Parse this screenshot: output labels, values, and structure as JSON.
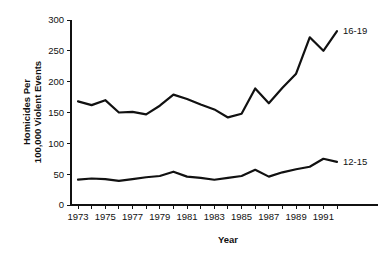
{
  "chart_data": {
    "type": "line",
    "title": "",
    "xlabel": "Year",
    "ylabel": "Homicides Per 100,000 Violent Events",
    "ylabel_line1": "Homicides Per",
    "ylabel_line2": "100,000 Violent Events",
    "grid": false,
    "legend_position": "inline-right",
    "xlim": [
      1973,
      1992
    ],
    "ylim": [
      0,
      300
    ],
    "ytick_values": [
      0,
      50,
      100,
      150,
      200,
      250,
      300
    ],
    "ytick_labels": [
      "0",
      "50",
      "100",
      "150",
      "200",
      "250",
      "300"
    ],
    "x": [
      1973,
      1974,
      1975,
      1976,
      1977,
      1978,
      1979,
      1980,
      1981,
      1982,
      1983,
      1984,
      1985,
      1986,
      1987,
      1988,
      1989,
      1990,
      1991,
      1992
    ],
    "xtick_values": [
      1973,
      1974,
      1975,
      1976,
      1977,
      1978,
      1979,
      1980,
      1981,
      1982,
      1983,
      1984,
      1985,
      1986,
      1987,
      1988,
      1989,
      1990,
      1991,
      1992
    ],
    "xtick_labels": [
      "1973",
      "",
      "1975",
      "",
      "1977",
      "",
      "1979",
      "",
      "1981",
      "",
      "1983",
      "",
      "1985",
      "",
      "1987",
      "",
      "1989",
      "",
      "1991",
      ""
    ],
    "series": [
      {
        "name": "16-19",
        "label": "16-19",
        "color": "#111111",
        "values": [
          168,
          162,
          170,
          150,
          151,
          147,
          161,
          179,
          172,
          163,
          155,
          142,
          148,
          189,
          165,
          190,
          213,
          272,
          250,
          282
        ]
      },
      {
        "name": "12-15",
        "label": "12-15",
        "color": "#111111",
        "values": [
          41,
          43,
          42,
          39,
          42,
          45,
          47,
          54,
          46,
          44,
          41,
          44,
          47,
          57,
          46,
          53,
          58,
          62,
          75,
          70
        ]
      }
    ]
  }
}
